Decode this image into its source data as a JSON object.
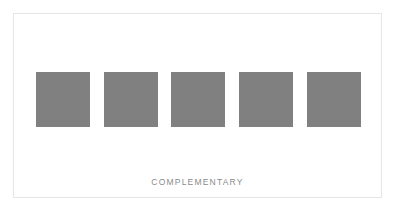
{
  "palette": {
    "name": "COMPLEMENTARY",
    "swatches": [
      {
        "color": "#808080"
      },
      {
        "color": "#808080"
      },
      {
        "color": "#808080"
      },
      {
        "color": "#808080"
      },
      {
        "color": "#808080"
      }
    ]
  }
}
